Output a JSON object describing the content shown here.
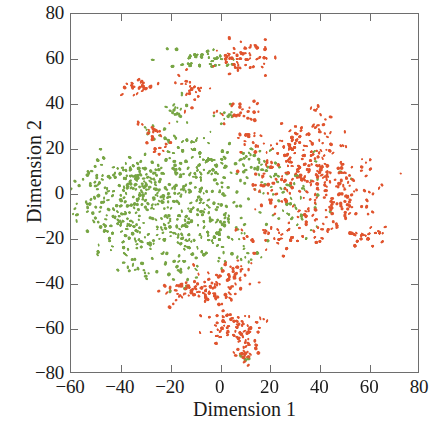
{
  "chart_data": {
    "type": "scatter",
    "title": "",
    "subtitle": "",
    "xlabel": "Dimension 1",
    "ylabel": "Dimension 2",
    "xlim": [
      -60,
      80
    ],
    "ylim": [
      -80,
      80
    ],
    "xticks": [
      -60,
      -40,
      -20,
      0,
      20,
      40,
      60,
      80
    ],
    "yticks": [
      -80,
      -60,
      -40,
      -20,
      0,
      20,
      40,
      60,
      80
    ],
    "xtick_labels": [
      "−60",
      "−40",
      "−20",
      "0",
      "20",
      "40",
      "60",
      "80"
    ],
    "ytick_labels": [
      "−80",
      "−60",
      "−40",
      "−20",
      "0",
      "20",
      "40",
      "60",
      "80"
    ],
    "grid": false,
    "legend": "none",
    "tick_direction": "in",
    "frame": "box",
    "marker_size": 2.0,
    "series": [
      {
        "name": "class-green",
        "color": "#77a544",
        "point_count": 612,
        "clusters": [
          {
            "cx": -42,
            "cy": -6,
            "sx": 11.0,
            "sy": 9.5,
            "n": 150
          },
          {
            "cx": -25,
            "cy": -4,
            "sx": 10.0,
            "sy": 10.0,
            "n": 120
          },
          {
            "cx": -9,
            "cy": -6,
            "sx": 9.0,
            "sy": 10.0,
            "n": 95
          },
          {
            "cx": -38,
            "cy": 8,
            "sx": 8.0,
            "sy": 4.0,
            "n": 42
          },
          {
            "cx": -15,
            "cy": 12,
            "sx": 8.0,
            "sy": 5.0,
            "n": 38
          },
          {
            "cx": 2,
            "cy": 13,
            "sx": 7.0,
            "sy": 5.0,
            "n": 34
          },
          {
            "cx": 14,
            "cy": 15,
            "sx": 5.0,
            "sy": 3.5,
            "n": 16
          },
          {
            "cx": -32,
            "cy": -20,
            "sx": 7.0,
            "sy": 4.5,
            "n": 36
          },
          {
            "cx": -14,
            "cy": -20,
            "sx": 7.0,
            "sy": 5.0,
            "n": 32
          },
          {
            "cx": 2,
            "cy": -16,
            "sx": 6.0,
            "sy": 6.0,
            "n": 28
          },
          {
            "cx": -16,
            "cy": -33,
            "sx": 5.0,
            "sy": 4.0,
            "n": 24
          },
          {
            "cx": -30,
            "cy": -35,
            "sx": 4.0,
            "sy": 2.0,
            "n": 14
          },
          {
            "cx": -18,
            "cy": 37,
            "sx": 3.0,
            "sy": 4.0,
            "n": 16
          },
          {
            "cx": -10,
            "cy": 60,
            "sx": 5.0,
            "sy": 2.5,
            "n": 20
          },
          {
            "cx": 1,
            "cy": 59,
            "sx": 4.0,
            "sy": 2.5,
            "n": 14
          },
          {
            "cx": -25,
            "cy": 27,
            "sx": 3.0,
            "sy": 2.5,
            "n": 10
          },
          {
            "cx": -17,
            "cy": 24,
            "sx": 3.5,
            "sy": 1.5,
            "n": 9
          },
          {
            "cx": -8,
            "cy": 24,
            "sx": 3.5,
            "sy": 1.5,
            "n": 8
          },
          {
            "cx": 3,
            "cy": 36,
            "sx": 3.0,
            "sy": 2.5,
            "n": 10
          },
          {
            "cx": 22,
            "cy": 6,
            "sx": 7.0,
            "sy": 6.0,
            "n": 30
          },
          {
            "cx": 34,
            "cy": 0,
            "sx": 7.0,
            "sy": 7.0,
            "n": 26
          },
          {
            "cx": 30,
            "cy": -10,
            "sx": 6.0,
            "sy": 5.0,
            "n": 18
          },
          {
            "cx": 8,
            "cy": -30,
            "sx": 4.0,
            "sy": 3.0,
            "n": 12
          },
          {
            "cx": 10,
            "cy": -74,
            "sx": 1.6,
            "sy": 1.2,
            "n": 5
          }
        ]
      },
      {
        "name": "class-orange",
        "color": "#e0542e",
        "point_count": 548,
        "clusters": [
          {
            "cx": 42,
            "cy": 8,
            "sx": 9.0,
            "sy": 8.0,
            "n": 135
          },
          {
            "cx": 31,
            "cy": 15,
            "sx": 7.0,
            "sy": 5.0,
            "n": 55
          },
          {
            "cx": 49,
            "cy": -4,
            "sx": 6.0,
            "sy": 6.0,
            "n": 50
          },
          {
            "cx": 22,
            "cy": 4,
            "sx": 6.0,
            "sy": 7.0,
            "n": 34
          },
          {
            "cx": 34,
            "cy": -14,
            "sx": 6.0,
            "sy": 5.0,
            "n": 30
          },
          {
            "cx": 22,
            "cy": -19,
            "sx": 6.0,
            "sy": 3.5,
            "n": 26
          },
          {
            "cx": 60,
            "cy": -19,
            "sx": 3.0,
            "sy": 2.0,
            "n": 22
          },
          {
            "cx": 31,
            "cy": 26,
            "sx": 4.0,
            "sy": 3.0,
            "n": 20
          },
          {
            "cx": 40,
            "cy": 34,
            "sx": 3.0,
            "sy": 3.0,
            "n": 14
          },
          {
            "cx": 8,
            "cy": 37,
            "sx": 4.0,
            "sy": 2.5,
            "n": 24
          },
          {
            "cx": 13,
            "cy": 24,
            "sx": 3.0,
            "sy": 2.5,
            "n": 14
          },
          {
            "cx": 12,
            "cy": 61,
            "sx": 4.5,
            "sy": 4.0,
            "n": 44
          },
          {
            "cx": 4,
            "cy": 60,
            "sx": 4.0,
            "sy": 2.0,
            "n": 14
          },
          {
            "cx": -12,
            "cy": 45,
            "sx": 3.0,
            "sy": 4.0,
            "n": 22
          },
          {
            "cx": -33,
            "cy": 48,
            "sx": 3.5,
            "sy": 2.0,
            "n": 26
          },
          {
            "cx": -28,
            "cy": 28,
            "sx": 3.5,
            "sy": 2.5,
            "n": 18
          },
          {
            "cx": -24,
            "cy": 21,
            "sx": 3.0,
            "sy": 2.0,
            "n": 10
          },
          {
            "cx": -9,
            "cy": -44,
            "sx": 7.0,
            "sy": 3.0,
            "n": 60
          },
          {
            "cx": 2,
            "cy": -41,
            "sx": 5.0,
            "sy": 4.0,
            "n": 34
          },
          {
            "cx": 7,
            "cy": -34,
            "sx": 3.5,
            "sy": 2.5,
            "n": 20
          },
          {
            "cx": 2,
            "cy": -60,
            "sx": 3.5,
            "sy": 3.5,
            "n": 38
          },
          {
            "cx": 11,
            "cy": -63,
            "sx": 3.0,
            "sy": 4.0,
            "n": 30
          },
          {
            "cx": 10,
            "cy": -71,
            "sx": 2.2,
            "sy": 3.0,
            "n": 22
          },
          {
            "cx": 17,
            "cy": -57,
            "sx": 1.5,
            "sy": 1.0,
            "n": 4
          }
        ]
      }
    ]
  }
}
